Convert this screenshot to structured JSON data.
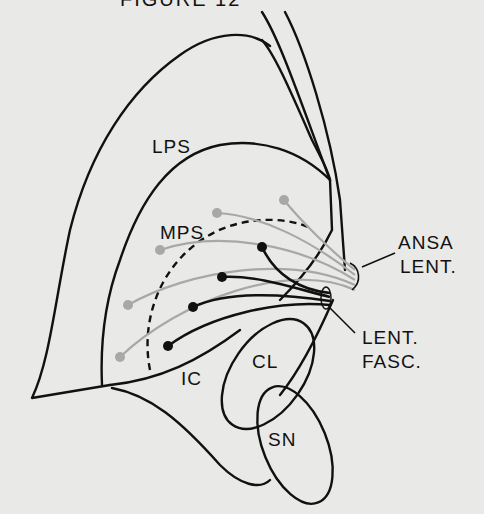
{
  "figure": {
    "top_caption_fragment": "FIGURE  12",
    "labels": {
      "lps": "LPS",
      "mps": "MPS",
      "ic": "IC",
      "cl": "CL",
      "sn": "SN",
      "ansa_line1": "ANSA",
      "ansa_line2": "LENT.",
      "fasc_line1": "LENT.",
      "fasc_line2": "FASC."
    },
    "legend": {
      "gray_fibers": "ansa lenticularis fibers (LPS/MPS origin)",
      "black_fibers": "lenticular fasciculus fibers (MPS origin)"
    },
    "colors": {
      "outline": "#111111",
      "gray_fiber": "#a8a8a6",
      "black_fiber": "#111111",
      "background": "#e9e9e7"
    }
  }
}
